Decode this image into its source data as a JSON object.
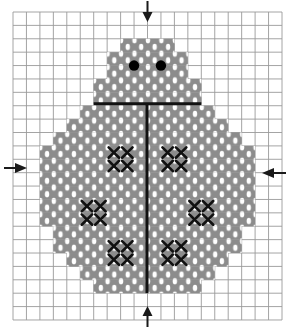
{
  "pattern": {
    "title": "Ladybug cross-stitch chart",
    "grid": {
      "cols": 20,
      "rows": 23,
      "left": 13,
      "top": 12,
      "cell_w": 13.45,
      "cell_h": 13.39,
      "line_color": "#9a9a9a"
    },
    "colors": {
      "fill": "#8c8c8c",
      "fill_highlight": "#ffffff",
      "spot": "#111111",
      "line": "#111111",
      "eye": "#000000",
      "arrow": "#1a1a1a"
    },
    "body_rows": [
      {
        "row": 2,
        "from": 8,
        "to": 11
      },
      {
        "row": 3,
        "from": 7,
        "to": 12
      },
      {
        "row": 4,
        "from": 7,
        "to": 12
      },
      {
        "row": 5,
        "from": 6,
        "to": 13
      },
      {
        "row": 6,
        "from": 6,
        "to": 13
      },
      {
        "row": 7,
        "from": 5,
        "to": 14
      },
      {
        "row": 8,
        "from": 4,
        "to": 15
      },
      {
        "row": 9,
        "from": 3,
        "to": 16
      },
      {
        "row": 10,
        "from": 2,
        "to": 17
      },
      {
        "row": 11,
        "from": 2,
        "to": 17
      },
      {
        "row": 12,
        "from": 2,
        "to": 17
      },
      {
        "row": 13,
        "from": 2,
        "to": 17
      },
      {
        "row": 14,
        "from": 2,
        "to": 17
      },
      {
        "row": 15,
        "from": 2,
        "to": 17
      },
      {
        "row": 16,
        "from": 3,
        "to": 16
      },
      {
        "row": 17,
        "from": 3,
        "to": 16
      },
      {
        "row": 18,
        "from": 4,
        "to": 15
      },
      {
        "row": 19,
        "from": 5,
        "to": 14
      },
      {
        "row": 20,
        "from": 6,
        "to": 13
      }
    ],
    "spots": [
      {
        "col": 7,
        "row": 10
      },
      {
        "col": 11,
        "row": 10
      },
      {
        "col": 5,
        "row": 14
      },
      {
        "col": 13,
        "row": 14
      },
      {
        "col": 7,
        "row": 17
      },
      {
        "col": 11,
        "row": 17
      }
    ],
    "eyes": [
      {
        "col": 9,
        "row": 4
      },
      {
        "col": 11,
        "row": 4
      }
    ],
    "backstitch": {
      "horizontal": {
        "row": 7,
        "from_col": 6,
        "to_col": 14
      },
      "vertical": {
        "col": 10,
        "from_row": 7,
        "to_row": 21
      }
    },
    "center_arrows": [
      {
        "name": "top-center-arrow",
        "direction": "down"
      },
      {
        "name": "bottom-center-arrow",
        "direction": "up"
      },
      {
        "name": "left-center-arrow",
        "direction": "right"
      },
      {
        "name": "right-center-arrow",
        "direction": "left"
      }
    ]
  }
}
